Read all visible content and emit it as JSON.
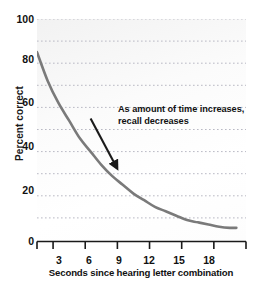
{
  "chart_data": {
    "type": "line",
    "title": "",
    "subtitle": "",
    "xlabel": "Seconds since hearing letter combination",
    "ylabel": "Percent correct",
    "xlim": [
      0,
      19.5
    ],
    "ylim": [
      0,
      100
    ],
    "grid": true,
    "grid_style": "dotted-horizontal",
    "grid_interval": 10,
    "legend": "none",
    "y_ticks": [
      100,
      80,
      60,
      40,
      20,
      0
    ],
    "y_tick_labels": [
      "100",
      "80",
      "60",
      "40",
      "20",
      "0"
    ],
    "x_ticks": [
      1.5,
      4.5,
      7.5,
      10.5,
      13.5,
      16.5,
      19.5
    ],
    "x_tick_labels": [
      "3",
      "6",
      "9",
      "12",
      "15",
      "18"
    ],
    "x_label_values": [
      3,
      6,
      9,
      12,
      15,
      18
    ],
    "series": [
      {
        "name": "Recall accuracy",
        "color": "#7a7a7a",
        "x": [
          0,
          1,
          2,
          3,
          4,
          5,
          6,
          7,
          8,
          9,
          10,
          11,
          12,
          13,
          14,
          15,
          16,
          17,
          18,
          18.6
        ],
        "values": [
          85,
          72,
          62,
          54,
          46,
          40,
          34,
          29,
          25,
          21,
          18,
          15,
          13,
          11,
          9,
          8,
          7,
          6,
          5.5,
          5.5
        ]
      }
    ],
    "annotations": [
      {
        "text_line_1": "As amount of time increases,",
        "text_line_2": "recall decreases",
        "arrow": {
          "from_x": 5.0,
          "from_y": 55,
          "to_x": 7.3,
          "to_y": 34,
          "color": "#1a1a1a"
        }
      }
    ]
  },
  "axes": {
    "y_label": "Percent correct",
    "x_label": "Seconds since hearing letter combination",
    "y_tick_labels": [
      "100",
      "80",
      "60",
      "40",
      "20",
      "0"
    ],
    "x_tick_labels": [
      "3",
      "6",
      "9",
      "12",
      "15",
      "18"
    ]
  },
  "annotation": {
    "line1": "As amount of time increases,",
    "line2": "recall decreases"
  },
  "colors": {
    "curve": "#7a7a7a",
    "gridline": "#b9b9c4",
    "axis": "#1a1a1a",
    "text": "#111111",
    "plot_background": "#fbfbfb"
  }
}
